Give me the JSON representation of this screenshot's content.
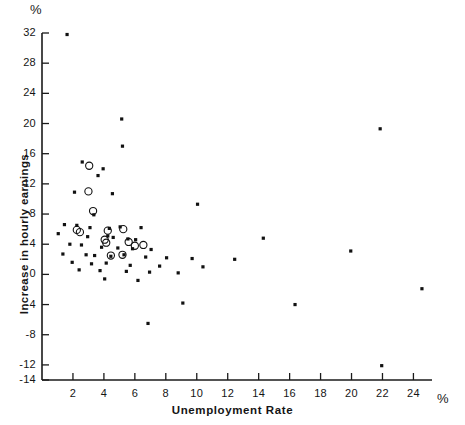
{
  "figure": {
    "top_unit": "%",
    "right_unit": "%"
  },
  "chart_data": {
    "type": "scatter",
    "title": "",
    "subtitle": "",
    "xlabel": "Unemployment Rate",
    "ylabel": "Increase in hourly earnings",
    "x_unit": "%",
    "y_unit": "%",
    "xlim": [
      0,
      25.2
    ],
    "ylim": [
      -14,
      32
    ],
    "xticks": [
      2,
      4,
      6,
      8,
      10,
      12,
      14,
      16,
      18,
      20,
      22,
      24
    ],
    "yticks": [
      32,
      28,
      24,
      20,
      16,
      12,
      8,
      4,
      0,
      -4,
      -8,
      -12,
      -14
    ],
    "xtick_labels": [
      "2",
      "4",
      "6",
      "8",
      "10",
      "12",
      "14",
      "16",
      "18",
      "20",
      "22",
      "24"
    ],
    "ytick_labels": [
      "32",
      "28",
      "24",
      "20",
      "16",
      "12",
      "8",
      "4",
      "0",
      "-4",
      "-8",
      "-12",
      "-14"
    ],
    "grid": false,
    "legend": [],
    "legend_position": "none",
    "marker_colors": {
      "dot": "#111111",
      "circle": "#111111"
    },
    "series": [
      {
        "name": "dot",
        "marker": "filled-dot",
        "points": [
          [
            1.62,
            31.8
          ],
          [
            5.15,
            20.6
          ],
          [
            5.2,
            17.0
          ],
          [
            2.6,
            14.9
          ],
          [
            3.95,
            14.0
          ],
          [
            3.62,
            13.1
          ],
          [
            2.1,
            10.9
          ],
          [
            4.55,
            10.7
          ],
          [
            10.05,
            9.3
          ],
          [
            3.35,
            7.9
          ],
          [
            1.45,
            6.6
          ],
          [
            2.25,
            6.5
          ],
          [
            3.1,
            6.2
          ],
          [
            4.35,
            6.1
          ],
          [
            5.05,
            6.3
          ],
          [
            6.4,
            6.2
          ],
          [
            1.05,
            5.4
          ],
          [
            2.95,
            5.0
          ],
          [
            4.25,
            5.1
          ],
          [
            4.6,
            4.9
          ],
          [
            5.55,
            4.7
          ],
          [
            6.05,
            4.6
          ],
          [
            14.3,
            4.8
          ],
          [
            1.8,
            4.0
          ],
          [
            2.55,
            3.9
          ],
          [
            3.85,
            3.6
          ],
          [
            4.9,
            3.5
          ],
          [
            5.85,
            3.4
          ],
          [
            7.05,
            3.3
          ],
          [
            19.95,
            3.1
          ],
          [
            1.35,
            2.7
          ],
          [
            2.85,
            2.6
          ],
          [
            3.4,
            2.5
          ],
          [
            4.45,
            2.4
          ],
          [
            5.3,
            2.6
          ],
          [
            6.7,
            2.3
          ],
          [
            8.05,
            2.2
          ],
          [
            9.7,
            2.1
          ],
          [
            12.45,
            2.0
          ],
          [
            21.85,
            19.3
          ],
          [
            1.95,
            1.6
          ],
          [
            3.2,
            1.4
          ],
          [
            4.15,
            1.5
          ],
          [
            5.7,
            1.2
          ],
          [
            7.6,
            1.1
          ],
          [
            10.4,
            1.0
          ],
          [
            2.4,
            0.6
          ],
          [
            3.75,
            0.5
          ],
          [
            5.45,
            0.4
          ],
          [
            6.95,
            0.3
          ],
          [
            8.8,
            0.2
          ],
          [
            4.05,
            -0.6
          ],
          [
            6.2,
            -0.8
          ],
          [
            24.55,
            -1.9
          ],
          [
            9.1,
            -3.8
          ],
          [
            16.35,
            -4.0
          ],
          [
            6.85,
            -6.5
          ],
          [
            21.95,
            -12.1
          ]
        ]
      },
      {
        "name": "circle",
        "marker": "open-circle",
        "points": [
          [
            3.05,
            14.4
          ],
          [
            3.0,
            11.0
          ],
          [
            3.3,
            8.4
          ],
          [
            2.25,
            5.9
          ],
          [
            2.45,
            5.6
          ],
          [
            4.25,
            5.8
          ],
          [
            5.25,
            6.0
          ],
          [
            4.05,
            4.6
          ],
          [
            4.15,
            4.2
          ],
          [
            5.6,
            4.3
          ],
          [
            6.0,
            3.8
          ],
          [
            6.55,
            3.9
          ],
          [
            4.45,
            2.5
          ],
          [
            5.2,
            2.6
          ]
        ]
      }
    ]
  }
}
